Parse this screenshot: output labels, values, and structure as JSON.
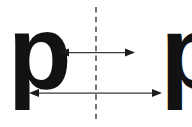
{
  "figure": {
    "title": "Reflection symmetry of letters p and q about a vertical mirror line",
    "type": "geometry-diagram",
    "canvas": {
      "width": 192,
      "height": 127,
      "background": "#ffffff"
    },
    "letters": [
      {
        "name": "left-letter",
        "character": "p",
        "x": 8,
        "baseline": 88,
        "font_size": 104,
        "color": "#121212",
        "transform": "none"
      },
      {
        "name": "right-letter",
        "character": "q",
        "x": 184,
        "baseline": 88,
        "font_size": 104,
        "color": "#121212",
        "transform": "horizontal-mirror"
      }
    ],
    "mirror_line": {
      "name": "vertical-dashed-axis",
      "x": 96,
      "y_start": 7,
      "y_end": 119,
      "color": "#6e6e6e",
      "style": "dashed",
      "dash_length": 5.5,
      "gap_length": 4.2,
      "width": 1.9
    },
    "arrows": [
      {
        "name": "upper-correspondence-arrow",
        "y": 52,
        "x_start": 59,
        "x_end": 135,
        "double_headed": true,
        "color": "#3a3a3a",
        "head_color": "#1c1c1c",
        "distance_left_of_axis": 37,
        "distance_right_of_axis": 39
      },
      {
        "name": "lower-correspondence-arrow",
        "y": 93,
        "x_start": 29,
        "x_end": 162,
        "double_headed": true,
        "color": "#3a3a3a",
        "head_color": "#1c1c1c",
        "distance_left_of_axis": 67,
        "distance_right_of_axis": 66
      }
    ]
  }
}
